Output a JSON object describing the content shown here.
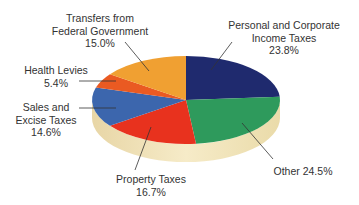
{
  "chart_data": {
    "type": "pie",
    "style": "3d",
    "title": "",
    "start_angle_deg": 90,
    "direction": "clockwise",
    "slices": [
      {
        "label": "Personal and Corporate Income Taxes",
        "label_lines": [
          "Personal and Corporate",
          "Income Taxes",
          "23.8%"
        ],
        "value": 23.8,
        "color": "#1f2a6e"
      },
      {
        "label": "Other",
        "label_lines": [
          "Other 24.5%"
        ],
        "value": 24.5,
        "color": "#2e9a5c"
      },
      {
        "label": "Property Taxes",
        "label_lines": [
          "Property Taxes",
          "16.7%"
        ],
        "value": 16.7,
        "color": "#e8321e"
      },
      {
        "label": "Sales and Excise Taxes",
        "label_lines": [
          "Sales and",
          "Excise Taxes",
          "14.6%"
        ],
        "value": 14.6,
        "color": "#3c66ad"
      },
      {
        "label": "Health Levies",
        "label_lines": [
          "Health Levies",
          "5.4%"
        ],
        "value": 5.4,
        "color": "#ea5a22"
      },
      {
        "label": "Transfers from Federal Government",
        "label_lines": [
          "Transfers from",
          "Federal Government",
          "15.0%"
        ],
        "value": 15.0,
        "color": "#f0a032"
      }
    ],
    "base_color": "#f2e3b8",
    "legend": "none (leader-line labels)"
  },
  "labels": {
    "personal": {
      "l1": "Personal and Corporate",
      "l2": "Income Taxes",
      "l3": "23.8%"
    },
    "other": {
      "l1": "Other 24.5%"
    },
    "property": {
      "l1": "Property Taxes",
      "l2": "16.7%"
    },
    "sales": {
      "l1": "Sales and",
      "l2": "Excise Taxes",
      "l3": "14.6%"
    },
    "health": {
      "l1": "Health Levies",
      "l2": "5.4%"
    },
    "transfers": {
      "l1": "Transfers from",
      "l2": "Federal Government",
      "l3": "15.0%"
    }
  }
}
